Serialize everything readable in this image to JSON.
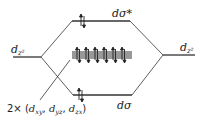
{
  "diagram": {
    "type": "molecular-orbital-energy-level-diagram",
    "colors": {
      "line": "#333333",
      "text": "#222222",
      "background": "#ffffff"
    },
    "levels": {
      "left_dz2": {
        "label_main": "d",
        "label_sub": "z²"
      },
      "right_dz2": {
        "label_main": "d",
        "label_sub": "z²"
      },
      "d_sigma_star": {
        "label": "dσ*",
        "electrons": 2
      },
      "nonbonding": {
        "electrons": 12,
        "arrow_pairs": 6
      },
      "d_sigma": {
        "label": "dσ",
        "electrons": 2
      }
    },
    "nonbonding_label": {
      "prefix": "2× (",
      "orbitals": [
        {
          "main": "d",
          "sub": "xy"
        },
        {
          "main": "d",
          "sub": "yz"
        },
        {
          "main": "d",
          "sub": "zx"
        }
      ],
      "separator": ", ",
      "suffix": ")"
    }
  }
}
